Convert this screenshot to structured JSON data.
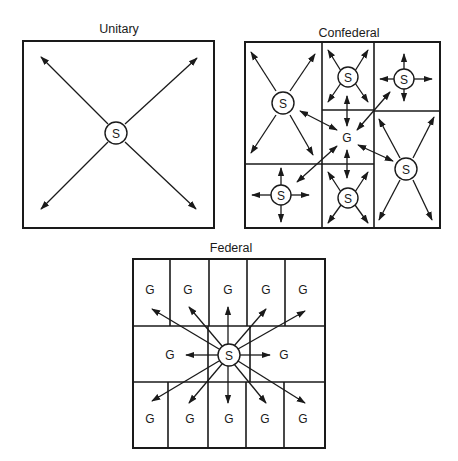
{
  "diagrams": [
    {
      "id": "unitary",
      "title": "Unitary",
      "center_label": "S",
      "description": "Single state authority radiating power in four diagonal directions"
    },
    {
      "id": "confederal",
      "title": "Confederal",
      "center_label": "G",
      "state_label": "S",
      "state_count": 6,
      "description": "Six member states each with own authority; central G linked by two-way arrows"
    },
    {
      "id": "federal",
      "title": "Federal",
      "center_label": "S",
      "unit_label": "G",
      "unit_count": 12,
      "description": "Central S radiating to twelve G units"
    }
  ],
  "colors": {
    "ink": "#1a1a1a",
    "background": "#ffffff"
  }
}
